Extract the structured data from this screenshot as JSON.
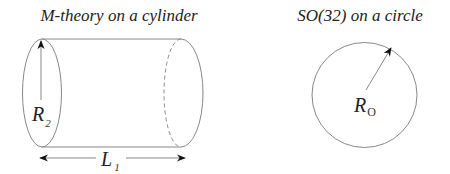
{
  "left_panel": {
    "title": "M-theory on a cylinder",
    "radius_label": {
      "main": "R",
      "subscript": "2"
    },
    "length_label": {
      "main": "L",
      "subscript": "1"
    }
  },
  "right_panel": {
    "title": "SO(32) on a circle",
    "radius_label": {
      "main": "R",
      "subscript": "O"
    }
  },
  "colors": {
    "stroke": "#888888",
    "text": "#222222",
    "arrowhead": "#111111"
  }
}
